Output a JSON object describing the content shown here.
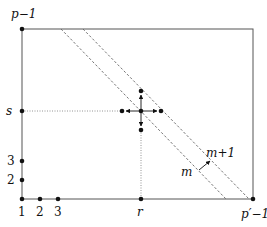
{
  "diagram": {
    "colors": {
      "line": "#555555",
      "dot": "#111111",
      "dashed": "#666666",
      "dotted": "#888888",
      "text": "#111111"
    },
    "labels": {
      "top_left": "p−1",
      "s": "s",
      "y3": "3",
      "y2": "2",
      "x1": "1",
      "x2": "2",
      "x3": "3",
      "r": "r",
      "bottom_right": "p′−1",
      "m": "m",
      "m_plus_1": "m+1"
    },
    "points": {
      "top_left_corner": [
        22,
        29
      ],
      "bottom_left_origin": [
        22,
        199
      ],
      "bottom_right_corner": [
        253,
        199
      ],
      "y2": [
        22,
        180
      ],
      "y3": [
        22,
        161
      ],
      "x2": [
        40,
        199
      ],
      "x3": [
        58,
        199
      ],
      "s_axis": [
        22,
        111
      ],
      "r_axis": [
        141,
        199
      ],
      "center": [
        141,
        111
      ],
      "up": [
        141,
        91
      ],
      "down": [
        141,
        130
      ],
      "left": [
        122,
        111
      ],
      "right": [
        161,
        111
      ]
    },
    "dashed_lines": [
      {
        "name": "line-m",
        "from": [
          61,
          29
        ],
        "to": [
          226,
          199
        ]
      },
      {
        "name": "line-m-plus-1",
        "from": [
          83,
          29
        ],
        "to": [
          249,
          199
        ]
      }
    ]
  }
}
